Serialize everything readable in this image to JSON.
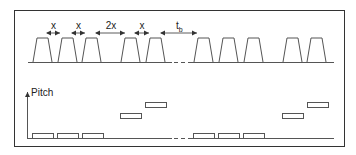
{
  "diagram": {
    "top_panel": {
      "interval_labels": [
        "x",
        "x",
        "2x",
        "x"
      ],
      "break_label": "t",
      "break_label_sub": "b",
      "pulse_count_before_break": 5,
      "pulse_count_after_break": 5
    },
    "bottom_panel": {
      "y_axis_label": "Pitch",
      "steps_before_break": [
        "low",
        "low",
        "low",
        "mid",
        "high"
      ],
      "steps_after_break": [
        "low",
        "low",
        "low",
        "mid",
        "high"
      ]
    },
    "colors": {
      "stroke": "#444444",
      "frame": "#333333",
      "background": "#ffffff"
    }
  }
}
